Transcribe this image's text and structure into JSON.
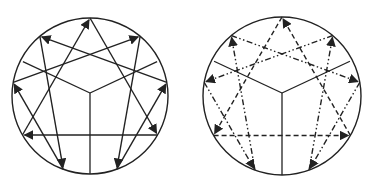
{
  "figure": {
    "type": "enneagram-pair",
    "colors": {
      "line": "#222222",
      "background": "#ffffff"
    },
    "diagrams": [
      {
        "name": "disintegration",
        "center": [
          90,
          96
        ],
        "radius": 78,
        "line_style": "solid",
        "triangle_path": [
          9,
          3,
          6,
          9
        ],
        "hexad_path": [
          1,
          4,
          2,
          8,
          5,
          7,
          1
        ]
      },
      {
        "name": "integration",
        "center": [
          282,
          96
        ],
        "radius": 79,
        "triangle_style": "dashed",
        "hexad_style": "dash-dot-dot",
        "triangle_path": [
          9,
          6,
          3,
          9
        ],
        "hexad_path": [
          1,
          7,
          5,
          8,
          2,
          4,
          1
        ]
      }
    ]
  }
}
